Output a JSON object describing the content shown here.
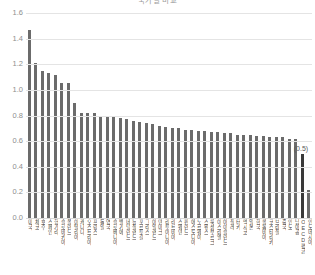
{
  "chart_data": {
    "type": "bar",
    "title": "국가별 비교",
    "xlabel": "",
    "ylabel": "",
    "ylim": [
      0.0,
      1.6
    ],
    "ytick_labels": [
      "1.6",
      "1.4",
      "1.2",
      "1.0",
      "0.8",
      "0.6",
      "0.4",
      "0.2",
      "0.0"
    ],
    "ytick_values": [
      1.6,
      1.4,
      1.2,
      1.0,
      0.8,
      0.6,
      0.4,
      0.2,
      0.0
    ],
    "grid": true,
    "legend": "none",
    "bar_color": "#6b6b6b",
    "highlight_color": "#3a3a3a",
    "gridline_color": "#e4e4e4",
    "axis_text_color": "#8e8e8e",
    "highlight_index": 42,
    "highlight_label": "(0.5)",
    "categories": [
      "미국",
      "체코",
      "호주",
      "스페인",
      "헝가리",
      "슬로바키아",
      "폴란드",
      "이탈리아",
      "캐나다",
      "오스트리아",
      "프랑스",
      "독일",
      "영국",
      "슬로베니아",
      "벨기에",
      "네덜란드",
      "뉴질랜드",
      "포르투갈",
      "그리스",
      "아일랜드",
      "덴마크",
      "리투아니아",
      "라트비아",
      "스웨덴",
      "핀란드",
      "에스토니아",
      "노르웨이",
      "스위스",
      "룩셈부르크",
      "이스라엘",
      "아이슬란드",
      "칠레",
      "터키",
      "멕시코",
      "일본",
      "한국",
      "콜롬비아",
      "코스타리카",
      "브라질",
      "중국",
      "인도",
      "남아공",
      "OECD평균",
      "인도네시아"
    ],
    "values": [
      1.47,
      1.21,
      1.15,
      1.13,
      1.12,
      1.05,
      1.05,
      0.9,
      0.82,
      0.82,
      0.82,
      0.8,
      0.8,
      0.79,
      0.78,
      0.77,
      0.76,
      0.75,
      0.74,
      0.73,
      0.72,
      0.71,
      0.7,
      0.7,
      0.69,
      0.69,
      0.68,
      0.68,
      0.67,
      0.67,
      0.66,
      0.66,
      0.65,
      0.65,
      0.65,
      0.64,
      0.64,
      0.63,
      0.63,
      0.63,
      0.62,
      0.62,
      0.5,
      0.22
    ]
  }
}
